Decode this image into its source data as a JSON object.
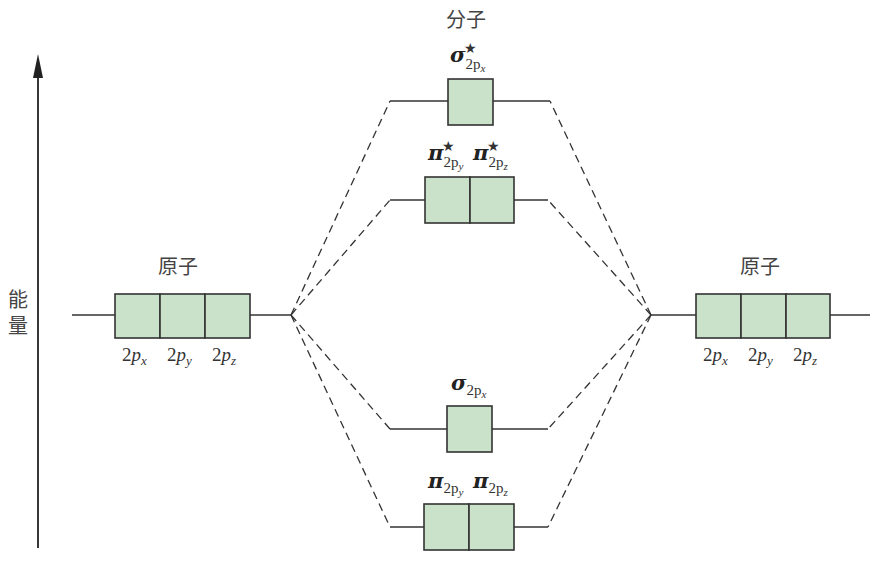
{
  "diagram": {
    "type": "molecular-orbital-energy-diagram",
    "axis": {
      "label_line1": "能",
      "label_line2": "量",
      "direction": "up"
    },
    "molecule_title": "分子",
    "left_atom": {
      "title": "原子",
      "orbitals": [
        {
          "base": "2",
          "p": "p",
          "sub": "x"
        },
        {
          "base": "2",
          "p": "p",
          "sub": "y"
        },
        {
          "base": "2",
          "p": "p",
          "sub": "z"
        }
      ]
    },
    "right_atom": {
      "title": "原子",
      "orbitals": [
        {
          "base": "2",
          "p": "p",
          "sub": "x"
        },
        {
          "base": "2",
          "p": "p",
          "sub": "y"
        },
        {
          "base": "2",
          "p": "p",
          "sub": "z"
        }
      ]
    },
    "molecular_orbitals": [
      {
        "id": "sigma-star-2px",
        "symbol": "σ",
        "star": "★",
        "sub": "2p",
        "subsub": "x",
        "boxes": 1,
        "order": "highest"
      },
      {
        "id": "pi-star-2py",
        "symbol": "π",
        "star": "★",
        "sub": "2p",
        "subsub": "y",
        "boxes": 1
      },
      {
        "id": "pi-star-2pz",
        "symbol": "π",
        "star": "★",
        "sub": "2p",
        "subsub": "z",
        "boxes": 1
      },
      {
        "id": "sigma-2px",
        "symbol": "σ",
        "star": "",
        "sub": "2p",
        "subsub": "x",
        "boxes": 1
      },
      {
        "id": "pi-2py",
        "symbol": "π",
        "star": "",
        "sub": "2p",
        "subsub": "y",
        "boxes": 1
      },
      {
        "id": "pi-2pz",
        "symbol": "π",
        "star": "",
        "sub": "2p",
        "subsub": "z",
        "boxes": 1,
        "order": "lowest"
      }
    ],
    "colors": {
      "box_fill": "#c9e2c9",
      "line": "#333333"
    }
  }
}
